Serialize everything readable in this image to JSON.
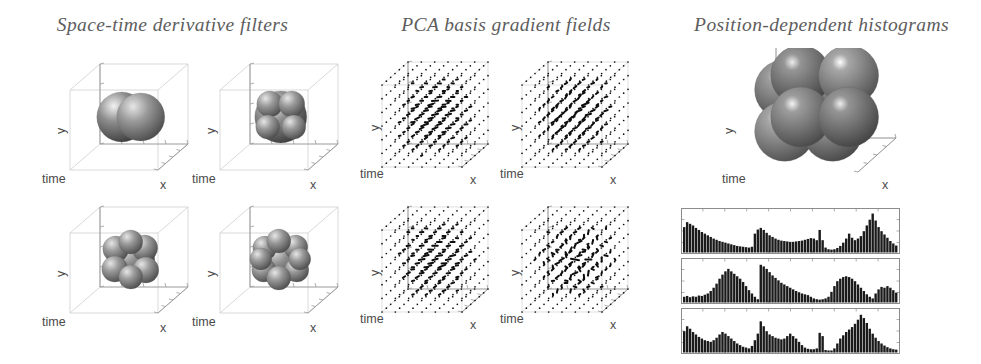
{
  "figure": {
    "width": 981,
    "height": 364,
    "background": "#ffffff",
    "ink": "#1a1a1a",
    "axis_color": "#9a9a9a",
    "title_color": "#5d5d5d"
  },
  "titles": [
    {
      "id": "space-time-derivative-filters",
      "text": "Space-time derivative filters",
      "cx": 172,
      "y": 14
    },
    {
      "id": "pca-basis-gradient-fields",
      "text": "PCA basis gradient fields",
      "cx": 505,
      "y": 14
    },
    {
      "id": "position-dependent-histograms",
      "text": "Position-dependent histograms",
      "cx": 810,
      "y": 14
    }
  ],
  "axes_labels": {
    "x": "x",
    "y": "y",
    "time": "time"
  },
  "filters": {
    "panels": [
      {
        "id": "filter-dx",
        "label": "derivative filter dx",
        "left": 40,
        "top": 62,
        "lobes": "split-x"
      },
      {
        "id": "filter-dy",
        "label": "derivative filter dy",
        "left": 190,
        "top": 62,
        "lobes": "split-y"
      },
      {
        "id": "filter-dxy",
        "label": "derivative filter dxy",
        "left": 40,
        "top": 205,
        "lobes": "multi-6"
      },
      {
        "id": "filter-dxyt",
        "label": "derivative filter dxyt",
        "left": 190,
        "top": 205,
        "lobes": "multi-8"
      }
    ]
  },
  "gradient_fields": {
    "panels": [
      {
        "id": "pca-basis-1",
        "label": "PCA basis gradient field 1",
        "left": 360,
        "top": 55,
        "orientation": "rows-horizontal",
        "seed": 11
      },
      {
        "id": "pca-basis-2",
        "label": "PCA basis gradient field 2",
        "left": 500,
        "top": 55,
        "orientation": "diagonal",
        "seed": 23
      },
      {
        "id": "pca-basis-3",
        "label": "PCA basis gradient field 3",
        "left": 360,
        "top": 200,
        "orientation": "rows-horizontal",
        "seed": 37
      },
      {
        "id": "pca-basis-4",
        "label": "PCA basis gradient field 4",
        "left": 500,
        "top": 200,
        "orientation": "random",
        "seed": 53
      }
    ]
  },
  "sphere_cluster": {
    "id": "position-dependent-bins",
    "label": "position-dependent spatial bins",
    "left": 700,
    "top": 48,
    "width": 250,
    "height": 155
  },
  "chart_data": [
    {
      "type": "bar",
      "id": "histogram-1",
      "title": "Position-dependent histogram 1",
      "xlabel": "",
      "ylabel": "",
      "ylim": [
        0,
        1
      ],
      "grid": false,
      "bar_color": "#1a1a1a",
      "frame": {
        "left": 681,
        "top": 208,
        "width": 219,
        "height": 46
      },
      "values": [
        0.62,
        0.74,
        0.7,
        0.66,
        0.6,
        0.55,
        0.5,
        0.46,
        0.42,
        0.38,
        0.34,
        0.31,
        0.28,
        0.26,
        0.24,
        0.22,
        0.2,
        0.18,
        0.16,
        0.15,
        0.14,
        0.13,
        0.12,
        0.14,
        0.46,
        0.56,
        0.6,
        0.55,
        0.48,
        0.42,
        0.38,
        0.34,
        0.31,
        0.29,
        0.28,
        0.27,
        0.26,
        0.26,
        0.27,
        0.28,
        0.29,
        0.31,
        0.33,
        0.35,
        0.34,
        0.3,
        0.55,
        0.3,
        0.12,
        0.08,
        0.07,
        0.08,
        0.11,
        0.16,
        0.24,
        0.34,
        0.46,
        0.36,
        0.3,
        0.34,
        0.4,
        0.52,
        0.66,
        0.8,
        0.95,
        0.78,
        0.62,
        0.52,
        0.44,
        0.36,
        0.28,
        0.22,
        0.17
      ]
    },
    {
      "type": "bar",
      "id": "histogram-2",
      "title": "Position-dependent histogram 2",
      "xlabel": "",
      "ylabel": "",
      "ylim": [
        0,
        1
      ],
      "grid": false,
      "bar_color": "#1a1a1a",
      "frame": {
        "left": 681,
        "top": 258,
        "width": 219,
        "height": 46
      },
      "values": [
        0.14,
        0.16,
        0.13,
        0.15,
        0.14,
        0.17,
        0.16,
        0.19,
        0.22,
        0.28,
        0.36,
        0.46,
        0.58,
        0.68,
        0.76,
        0.82,
        0.76,
        0.7,
        0.64,
        0.58,
        0.5,
        0.4,
        0.3,
        0.22,
        0.14,
        0.08,
        0.92,
        0.88,
        0.82,
        0.74,
        0.66,
        0.6,
        0.54,
        0.48,
        0.44,
        0.4,
        0.36,
        0.32,
        0.28,
        0.25,
        0.22,
        0.2,
        0.18,
        0.14,
        0.1,
        0.08,
        0.07,
        0.08,
        0.1,
        0.14,
        0.26,
        0.4,
        0.52,
        0.58,
        0.62,
        0.64,
        0.62,
        0.58,
        0.52,
        0.44,
        0.36,
        0.28,
        0.2,
        0.14,
        0.1,
        0.22,
        0.32,
        0.38,
        0.36,
        0.4,
        0.36,
        0.3,
        0.24
      ]
    },
    {
      "type": "bar",
      "id": "histogram-3",
      "title": "Position-dependent histogram 3",
      "xlabel": "",
      "ylabel": "",
      "ylim": [
        0,
        1
      ],
      "grid": false,
      "bar_color": "#1a1a1a",
      "frame": {
        "left": 681,
        "top": 308,
        "width": 219,
        "height": 46
      },
      "values": [
        0.52,
        0.64,
        0.58,
        0.5,
        0.44,
        0.38,
        0.34,
        0.3,
        0.28,
        0.26,
        0.3,
        0.36,
        0.44,
        0.5,
        0.46,
        0.4,
        0.34,
        0.28,
        0.22,
        0.18,
        0.14,
        0.12,
        0.1,
        0.16,
        0.3,
        0.46,
        0.76,
        0.64,
        0.52,
        0.44,
        0.4,
        0.36,
        0.34,
        0.32,
        0.34,
        0.4,
        0.46,
        0.4,
        0.34,
        0.26,
        0.18,
        0.12,
        0.09,
        0.08,
        0.08,
        0.1,
        0.48,
        0.4,
        0.06,
        0.05,
        0.05,
        0.1,
        0.22,
        0.34,
        0.42,
        0.5,
        0.56,
        0.62,
        0.7,
        0.8,
        0.92,
        0.84,
        0.72,
        0.58,
        0.46,
        0.36,
        0.28,
        0.22,
        0.17,
        0.13,
        0.1,
        0.08,
        0.07
      ]
    }
  ]
}
